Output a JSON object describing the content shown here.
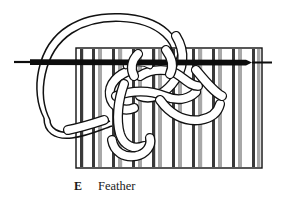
{
  "figure": {
    "title": "Feather",
    "caption_letter": "E",
    "caption_label": "Feather",
    "style": "black-and-white line drawing"
  },
  "colors": {
    "background": "#ffffff",
    "ink": "#111111",
    "stripe_dark": "#3a3a3a",
    "stripe_gray": "#a8a8a8",
    "stripe_light": "#d8d8d8",
    "cord_fill": "#ffffff",
    "needle": "#0d0d0d",
    "caption_text": "#1a1a1a"
  },
  "fabric": {
    "name": "striped-fabric-panel",
    "left": 76,
    "top": 48,
    "right": 262,
    "bottom": 168,
    "border_width": 1.4,
    "stripe_groups": [
      {
        "x": 80,
        "width": 3.2,
        "tone": "dark"
      },
      {
        "x": 92,
        "width": 3.0,
        "tone": "dark"
      },
      {
        "x": 98,
        "width": 4.0,
        "tone": "gray"
      },
      {
        "x": 112,
        "width": 3.0,
        "tone": "dark"
      },
      {
        "x": 118,
        "width": 4.2,
        "tone": "gray"
      },
      {
        "x": 132,
        "width": 3.0,
        "tone": "dark"
      },
      {
        "x": 138,
        "width": 4.0,
        "tone": "gray"
      },
      {
        "x": 152,
        "width": 3.2,
        "tone": "dark"
      },
      {
        "x": 158,
        "width": 4.0,
        "tone": "gray"
      },
      {
        "x": 172,
        "width": 3.0,
        "tone": "dark"
      },
      {
        "x": 178,
        "width": 4.0,
        "tone": "gray"
      },
      {
        "x": 192,
        "width": 3.0,
        "tone": "dark"
      },
      {
        "x": 198,
        "width": 4.2,
        "tone": "gray"
      },
      {
        "x": 212,
        "width": 3.0,
        "tone": "dark"
      },
      {
        "x": 218,
        "width": 4.0,
        "tone": "gray"
      },
      {
        "x": 232,
        "width": 3.0,
        "tone": "dark"
      },
      {
        "x": 238,
        "width": 4.0,
        "tone": "gray"
      },
      {
        "x": 252,
        "width": 3.0,
        "tone": "dark"
      },
      {
        "x": 257,
        "width": 3.4,
        "tone": "gray"
      }
    ]
  },
  "needle": {
    "name": "needle-bar",
    "y": 62,
    "x_start": 14,
    "x_end": 272,
    "thickness": 7.5,
    "tip_taper_x": 250,
    "tail_taper_x": 30
  },
  "threads": {
    "cord_width": 8.5,
    "outline_width": 1.4,
    "description": "interlaced white cord loops forming the feather stitch over the fabric"
  }
}
